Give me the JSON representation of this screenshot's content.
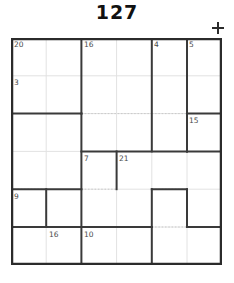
{
  "puzzle": {
    "title": "127",
    "plus_icon": "plus-icon",
    "grid": {
      "columns": 6,
      "rows": 6,
      "cell_width": 35.2,
      "cell_height": 37.8,
      "border_color": "#2b2b2b",
      "cage_color": "#3a3a3a",
      "thin_line_color": "#dcdcdc",
      "dotted_line_color": "#cfcfcf",
      "background": "#ffffff"
    },
    "cages": [
      {
        "id": "cage-20",
        "sum": "20",
        "col": 1,
        "row": 1
      },
      {
        "id": "cage-16-top",
        "sum": "16",
        "col": 3,
        "row": 1
      },
      {
        "id": "cage-4",
        "sum": "4",
        "col": 5,
        "row": 1
      },
      {
        "id": "cage-5",
        "sum": "5",
        "col": 6,
        "row": 1
      },
      {
        "id": "cage-3",
        "sum": "3",
        "col": 1,
        "row": 2
      },
      {
        "id": "cage-15",
        "sum": "15",
        "col": 6,
        "row": 2
      },
      {
        "id": "cage-7",
        "sum": "7",
        "col": 3,
        "row": 3
      },
      {
        "id": "cage-21",
        "sum": "21",
        "col": 4,
        "row": 3
      },
      {
        "id": "cage-9",
        "sum": "9",
        "col": 1,
        "row": 4
      },
      {
        "id": "cage-16-low",
        "sum": "16",
        "col": 2,
        "row": 5
      },
      {
        "id": "cage-10",
        "sum": "10",
        "col": 3,
        "row": 6
      }
    ]
  }
}
